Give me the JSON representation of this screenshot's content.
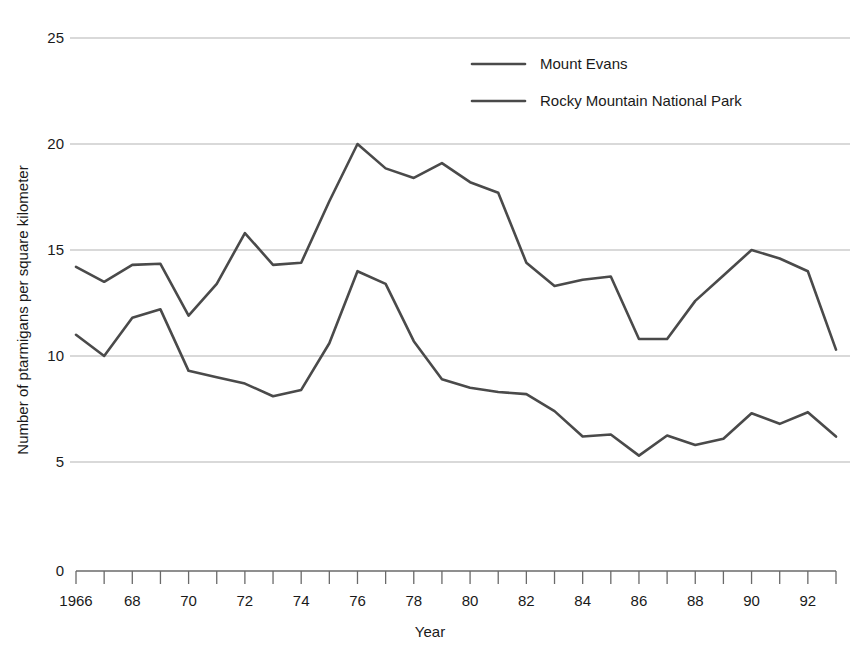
{
  "chart_data": {
    "type": "line",
    "title": "",
    "xlabel": "Year",
    "ylabel": "Number of ptarmigans per square kilometer",
    "xlim": [
      1966,
      1993
    ],
    "ylim": [
      0,
      25
    ],
    "yticks": [
      0,
      5,
      10,
      15,
      20,
      25
    ],
    "ytick_labels": [
      "0",
      "5",
      "10",
      "15",
      "20",
      "25"
    ],
    "grid": "horizontal",
    "axis_break_below": 5,
    "legend_position": "top-center-right",
    "x": [
      1966,
      1967,
      1968,
      1969,
      1970,
      1971,
      1972,
      1973,
      1974,
      1975,
      1976,
      1977,
      1978,
      1979,
      1980,
      1981,
      1982,
      1983,
      1984,
      1985,
      1986,
      1987,
      1988,
      1989,
      1990,
      1991,
      1992,
      1993
    ],
    "xtick_labels": [
      "1966",
      "",
      "68",
      "",
      "70",
      "",
      "72",
      "",
      "74",
      "",
      "76",
      "",
      "78",
      "",
      "80",
      "",
      "82",
      "",
      "84",
      "",
      "86",
      "",
      "88",
      "",
      "90",
      "",
      "92",
      ""
    ],
    "series": [
      {
        "name": "Mount Evans",
        "color": "#4a4a4a",
        "values": [
          11.0,
          10.0,
          11.8,
          12.2,
          9.3,
          9.0,
          8.7,
          8.1,
          8.4,
          10.6,
          14.0,
          13.4,
          10.7,
          8.9,
          8.5,
          8.3,
          8.2,
          7.4,
          6.2,
          6.3,
          5.3,
          6.25,
          5.8,
          6.1,
          7.3,
          6.8,
          7.35,
          6.2
        ]
      },
      {
        "name": "Rocky Mountain National Park",
        "color": "#4a4a4a",
        "values": [
          14.2,
          13.5,
          14.3,
          14.35,
          11.9,
          13.4,
          15.8,
          14.3,
          14.4,
          17.3,
          20.0,
          18.85,
          18.4,
          19.1,
          18.2,
          17.7,
          14.4,
          13.3,
          13.6,
          13.75,
          10.8,
          10.8,
          12.6,
          13.8,
          15.0,
          14.6,
          14.0,
          10.3
        ]
      }
    ]
  },
  "legend": {
    "items": [
      {
        "label": "Mount Evans"
      },
      {
        "label": "Rocky Mountain National Park"
      }
    ]
  },
  "colors": {
    "line": "#4a4a4a",
    "grid": "#b4b4b4",
    "axis": "#6a6a6a",
    "text": "#1a1a1a",
    "background": "#ffffff"
  }
}
